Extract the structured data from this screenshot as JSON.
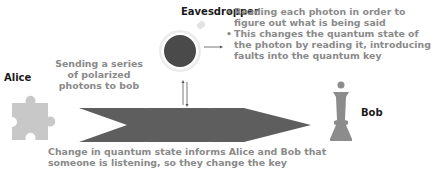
{
  "eavesdropper": {
    "title": "Eavesdropper",
    "bullets": [
      "Reading each photon in order to figure out what is being said",
      "This changes the quantum state of the photon by reading it, introducing faults into the quantum key"
    ]
  },
  "alice": {
    "label": "Alice",
    "icon": "puzzle-piece-icon"
  },
  "bob": {
    "label": "Bob",
    "icon": "chess-queen-icon"
  },
  "sending_text": "Sending a series of polarized photons to bob",
  "bottom_text": "Change in quantum state informs Alice and Bob that someone is listening, so they change the key",
  "colors": {
    "text_grey": "#8a8a8a",
    "arrow_grey": "#5e5e5e",
    "icon_grey": "#8c8c8c",
    "puzzle_grey": "#c8c8c8",
    "circle_dark": "#4a4a4a",
    "circle_ring": "#e2e2e2"
  }
}
